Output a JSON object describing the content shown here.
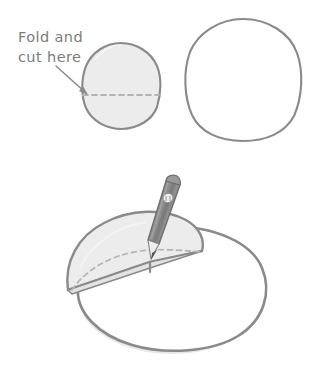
{
  "figure": {
    "background_color": "#ffffff"
  },
  "annotation": {
    "line1": "Fold and",
    "line2": "cut here",
    "text_color": "#7d7d7d",
    "arrow_name": "pointer-arrow"
  },
  "palette": {
    "outline": "#8a8a8a",
    "outline_dark": "#787878",
    "paper_fill": "#ececec",
    "paper_fill_light": "#f2f2f2",
    "white_fill": "#ffffff",
    "dashed_line": "#b4b4b4",
    "pencil_body": "#8d8d8d",
    "pencil_body_dark": "#6f6f6f",
    "pencil_wood": "#e8e8e8",
    "pencil_tip": "#555555",
    "shadow": "#c9c9c9"
  },
  "shapes": {
    "top_left_circle": {
      "name": "shaded-circle-with-fold-line",
      "cx": 121,
      "cy": 86,
      "rx": 39,
      "ry": 43,
      "filled": true,
      "fold_line_y": 95,
      "fold_line_label": "dashed fold line"
    },
    "top_right_circle": {
      "name": "plain-circle",
      "cx": 243,
      "cy": 80,
      "rx": 57,
      "ry": 61,
      "filled": false
    },
    "bottom_assembly": {
      "name": "folded-paper-with-pencil",
      "base_ellipse": {
        "cx": 168,
        "cy": 288,
        "rx": 96,
        "ry": 62
      },
      "folded_flap": {
        "label": "folded half disc",
        "crease_label": "dashed crease arc"
      },
      "pencil": {
        "label": "pencil",
        "tip_x": 150,
        "tip_y": 255,
        "top_x": 178,
        "top_y": 180
      }
    }
  }
}
